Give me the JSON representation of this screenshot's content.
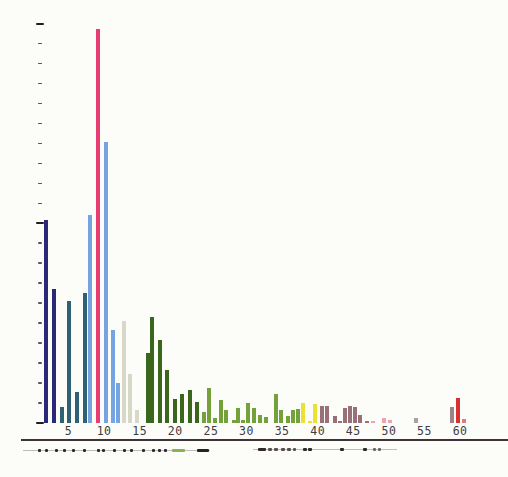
{
  "chart_data": {
    "type": "bar",
    "title": "",
    "xlabel": "",
    "ylabel": "",
    "x_tick_labels": [
      "5",
      "10",
      "15",
      "20",
      "25",
      "30",
      "35",
      "40",
      "45",
      "50",
      "55",
      "60"
    ],
    "x_ticks": [
      5,
      10,
      15,
      20,
      25,
      30,
      35,
      40,
      45,
      50,
      55,
      60
    ],
    "xlim": [
      1,
      63
    ],
    "ylim_percent": [
      0,
      100
    ],
    "grid": "off",
    "legend": "none",
    "y_axis_style": "unlabeled tick marks only; major ticks at 0, 50 and 100 percent with 9 minor ticks between each pair",
    "bar_width_units": 0.55,
    "palette": {
      "navy": "#2b2878",
      "teal": "#2f6275",
      "blue": "#74a5e2",
      "pink": "#e73d72",
      "gray_green": "#d8d8c8",
      "dark_green": "#3a661e",
      "green": "#74a13c",
      "yellow": "#e9e232",
      "mauve": "#9a7078",
      "light_pink": "#eba4b6",
      "gray": "#a8a3a2",
      "gray_mauve": "#9d8186",
      "red": "#d93032",
      "red_light": "#e37a76"
    },
    "bars": [
      {
        "x": 1.8,
        "h": 51.0,
        "c": "navy"
      },
      {
        "x": 2.9,
        "h": 33.5,
        "c": "navy"
      },
      {
        "x": 4.1,
        "h": 3.9,
        "c": "teal"
      },
      {
        "x": 5.1,
        "h": 30.5,
        "c": "teal"
      },
      {
        "x": 6.2,
        "h": 7.8,
        "c": "teal"
      },
      {
        "x": 7.3,
        "h": 32.6,
        "c": "teal"
      },
      {
        "x": 8.0,
        "h": 52.1,
        "c": "blue"
      },
      {
        "x": 9.1,
        "h": 98.7,
        "c": "pink"
      },
      {
        "x": 10.2,
        "h": 70.4,
        "c": "blue"
      },
      {
        "x": 11.2,
        "h": 23.3,
        "c": "blue"
      },
      {
        "x": 11.9,
        "h": 10.1,
        "c": "blue"
      },
      {
        "x": 12.8,
        "h": 25.6,
        "c": "gray_green"
      },
      {
        "x": 13.7,
        "h": 12.2,
        "c": "gray_green"
      },
      {
        "x": 14.6,
        "h": 3.2,
        "c": "gray_green"
      },
      {
        "x": 16.1,
        "h": 17.5,
        "c": "dark_green"
      },
      {
        "x": 16.7,
        "h": 26.5,
        "c": "dark_green"
      },
      {
        "x": 17.8,
        "h": 20.8,
        "c": "dark_green"
      },
      {
        "x": 18.9,
        "h": 13.3,
        "c": "dark_green"
      },
      {
        "x": 19.9,
        "h": 5.9,
        "c": "dark_green"
      },
      {
        "x": 21.0,
        "h": 7.2,
        "c": "dark_green"
      },
      {
        "x": 22.1,
        "h": 8.2,
        "c": "dark_green"
      },
      {
        "x": 23.1,
        "h": 5.3,
        "c": "dark_green"
      },
      {
        "x": 24.1,
        "h": 2.8,
        "c": "green"
      },
      {
        "x": 24.8,
        "h": 8.7,
        "c": "green"
      },
      {
        "x": 25.6,
        "h": 1.2,
        "c": "green"
      },
      {
        "x": 26.4,
        "h": 5.8,
        "c": "green"
      },
      {
        "x": 27.1,
        "h": 3.3,
        "c": "green"
      },
      {
        "x": 28.2,
        "h": 0.8,
        "c": "green"
      },
      {
        "x": 28.8,
        "h": 3.7,
        "c": "green"
      },
      {
        "x": 29.5,
        "h": 0.7,
        "c": "green"
      },
      {
        "x": 30.2,
        "h": 5.0,
        "c": "green"
      },
      {
        "x": 31.0,
        "h": 3.8,
        "c": "green"
      },
      {
        "x": 31.9,
        "h": 2.0,
        "c": "green"
      },
      {
        "x": 32.8,
        "h": 1.5,
        "c": "green"
      },
      {
        "x": 34.1,
        "h": 7.3,
        "c": "green"
      },
      {
        "x": 34.9,
        "h": 3.2,
        "c": "green"
      },
      {
        "x": 35.8,
        "h": 1.7,
        "c": "green"
      },
      {
        "x": 36.6,
        "h": 3.2,
        "c": "green"
      },
      {
        "x": 37.3,
        "h": 3.6,
        "c": "green"
      },
      {
        "x": 38.0,
        "h": 5.0,
        "c": "yellow"
      },
      {
        "x": 38.9,
        "h": 0.4,
        "c": "yellow"
      },
      {
        "x": 39.6,
        "h": 4.8,
        "c": "yellow"
      },
      {
        "x": 40.6,
        "h": 4.3,
        "c": "mauve"
      },
      {
        "x": 41.3,
        "h": 4.3,
        "c": "mauve"
      },
      {
        "x": 42.4,
        "h": 1.8,
        "c": "mauve"
      },
      {
        "x": 43.2,
        "h": 0.4,
        "c": "mauve"
      },
      {
        "x": 43.9,
        "h": 3.7,
        "c": "mauve"
      },
      {
        "x": 44.6,
        "h": 4.3,
        "c": "mauve"
      },
      {
        "x": 45.2,
        "h": 4.0,
        "c": "mauve"
      },
      {
        "x": 45.9,
        "h": 2.0,
        "c": "mauve"
      },
      {
        "x": 46.9,
        "h": 0.4,
        "c": "mauve"
      },
      {
        "x": 47.8,
        "h": 0.5,
        "c": "light_pink"
      },
      {
        "x": 49.3,
        "h": 1.3,
        "c": "light_pink"
      },
      {
        "x": 50.2,
        "h": 0.8,
        "c": "light_pink"
      },
      {
        "x": 53.8,
        "h": 1.2,
        "c": "gray"
      },
      {
        "x": 58.9,
        "h": 4.0,
        "c": "gray_mauve"
      },
      {
        "x": 59.7,
        "h": 6.3,
        "c": "red"
      },
      {
        "x": 60.6,
        "h": 1.0,
        "c": "red_light"
      }
    ]
  },
  "annotation_tracks": [
    {
      "side": "left",
      "x1": 23,
      "x2": 210,
      "y": 450,
      "marks": [
        {
          "x": 38,
          "w": 3,
          "color": "#2e2a2c"
        },
        {
          "x": 45,
          "w": 3,
          "color": "#2e2a2c"
        },
        {
          "x": 55,
          "w": 3,
          "color": "#2e2a2c"
        },
        {
          "x": 63,
          "w": 3,
          "color": "#2e2a2c"
        },
        {
          "x": 72,
          "w": 3,
          "color": "#2e2a2c"
        },
        {
          "x": 83,
          "w": 3,
          "color": "#2e2a2c"
        },
        {
          "x": 97,
          "w": 3,
          "color": "#2e2a2c"
        },
        {
          "x": 102,
          "w": 3,
          "color": "#2e2a2c"
        },
        {
          "x": 113,
          "w": 3,
          "color": "#2e2a2c"
        },
        {
          "x": 123,
          "w": 3,
          "color": "#2e2a2c"
        },
        {
          "x": 130,
          "w": 3,
          "color": "#2e2a2c"
        },
        {
          "x": 142,
          "w": 3,
          "color": "#2e2a2c"
        },
        {
          "x": 152,
          "w": 3,
          "color": "#2e2a2c"
        },
        {
          "x": 158,
          "w": 3,
          "color": "#2e2a2c"
        },
        {
          "x": 164,
          "w": 3,
          "color": "#2e2a2c"
        },
        {
          "x": 172,
          "w": 13,
          "color": "#8cb052"
        },
        {
          "x": 197,
          "w": 12,
          "color": "#262126"
        }
      ]
    },
    {
      "side": "right",
      "x1": 253,
      "x2": 397,
      "y": 449,
      "marks": [
        {
          "x": 258,
          "w": 8,
          "color": "#2e2a2c"
        },
        {
          "x": 268,
          "w": 4,
          "color": "#574f52"
        },
        {
          "x": 274,
          "w": 4,
          "color": "#574f52"
        },
        {
          "x": 281,
          "w": 4,
          "color": "#574f52"
        },
        {
          "x": 287,
          "w": 4,
          "color": "#574f52"
        },
        {
          "x": 293,
          "w": 3,
          "color": "#574f52"
        },
        {
          "x": 303,
          "w": 4,
          "color": "#2e2a2c"
        },
        {
          "x": 308,
          "w": 4,
          "color": "#2e2a2c"
        },
        {
          "x": 340,
          "w": 4,
          "color": "#2e2a2c"
        },
        {
          "x": 363,
          "w": 4,
          "color": "#2e2a2c"
        },
        {
          "x": 373,
          "w": 3,
          "color": "#6b6366"
        },
        {
          "x": 378,
          "w": 3,
          "color": "#6b6366"
        }
      ]
    }
  ],
  "axis_rule": {
    "x1": 21,
    "x2": 508,
    "y": 438.5
  }
}
